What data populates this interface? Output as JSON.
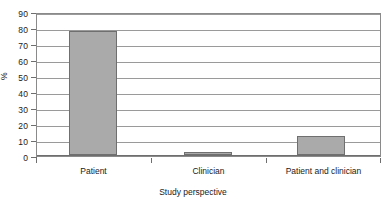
{
  "chart_data": {
    "type": "bar",
    "title": "",
    "subtitle": "",
    "xlabel": "Study perspective",
    "ylabel": "%",
    "categories": [
      "Patient",
      "Clinician",
      "Patient and clinician"
    ],
    "values": [
      79,
      2,
      12
    ],
    "series": [
      {
        "name": "",
        "values": [
          79,
          2,
          12
        ]
      }
    ],
    "ylim": [
      0,
      90
    ],
    "ytick_step": 10,
    "yticks": [
      0,
      10,
      20,
      30,
      40,
      50,
      60,
      70,
      80,
      90
    ],
    "ytick_labels": [
      "0",
      "10",
      "20",
      "30",
      "40",
      "50",
      "60",
      "70",
      "80",
      "90"
    ],
    "grid": true,
    "grid_axis": "y",
    "legend": false,
    "legend_position": "none",
    "annotations": [],
    "colors": {
      "bar_fill": "#aaaaaa",
      "bar_edge": "#6f6f6f",
      "gridline": "#9a9a9a",
      "axis": "#6e6e6e",
      "text": "#1a1a1a",
      "background": "#ffffff"
    }
  }
}
